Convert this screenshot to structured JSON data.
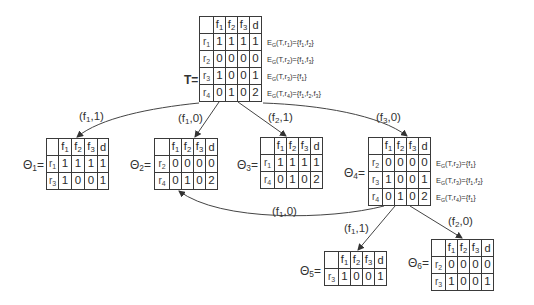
{
  "diagram": {
    "columns": [
      "f1",
      "f2",
      "f3",
      "d"
    ],
    "tables": [
      {
        "id": "T",
        "label": "T=",
        "rows": [
          {
            "name": "r1",
            "values": [
              "1",
              "1",
              "1",
              "1"
            ],
            "eg": "E_G(T,r1)={f1,f2}"
          },
          {
            "name": "r2",
            "values": [
              "0",
              "0",
              "0",
              "0"
            ],
            "eg": "E_G(T,r2)={f1,f3}"
          },
          {
            "name": "r3",
            "values": [
              "1",
              "0",
              "0",
              "1"
            ],
            "eg": "E_G(T,r3)={f1}"
          },
          {
            "name": "r4",
            "values": [
              "0",
              "1",
              "0",
              "2"
            ],
            "eg": "E_G(T,r4)={f1,f2,f3}"
          }
        ]
      },
      {
        "id": "Theta1",
        "label": "Θ1=",
        "rows": [
          {
            "name": "r1",
            "values": [
              "1",
              "1",
              "1",
              "1"
            ]
          },
          {
            "name": "r3",
            "values": [
              "1",
              "0",
              "0",
              "1"
            ]
          }
        ]
      },
      {
        "id": "Theta2",
        "label": "Θ2=",
        "rows": [
          {
            "name": "r2",
            "values": [
              "0",
              "0",
              "0",
              "0"
            ]
          },
          {
            "name": "r4",
            "values": [
              "0",
              "1",
              "0",
              "2"
            ]
          }
        ]
      },
      {
        "id": "Theta3",
        "label": "Θ3=",
        "rows": [
          {
            "name": "r1",
            "values": [
              "1",
              "1",
              "1",
              "1"
            ]
          },
          {
            "name": "r4",
            "values": [
              "0",
              "1",
              "0",
              "2"
            ]
          }
        ]
      },
      {
        "id": "Theta4",
        "label": "Θ4=",
        "rows": [
          {
            "name": "r2",
            "values": [
              "0",
              "0",
              "0",
              "0"
            ],
            "eg": "E_G(T,r2)={f1}"
          },
          {
            "name": "r3",
            "values": [
              "1",
              "0",
              "0",
              "1"
            ],
            "eg": "E_G(T,r3)={f1,f2}"
          },
          {
            "name": "r4",
            "values": [
              "0",
              "1",
              "0",
              "2"
            ],
            "eg": "E_G(T,r4)={f1}"
          }
        ]
      },
      {
        "id": "Theta5",
        "label": "Θ5=",
        "rows": [
          {
            "name": "r3",
            "values": [
              "1",
              "0",
              "0",
              "1"
            ]
          }
        ]
      },
      {
        "id": "Theta6",
        "label": "Θ6=",
        "rows": [
          {
            "name": "r2",
            "values": [
              "0",
              "0",
              "0",
              "0"
            ]
          },
          {
            "name": "r3",
            "values": [
              "1",
              "0",
              "0",
              "1"
            ]
          }
        ]
      }
    ],
    "edges": [
      {
        "from": "T",
        "to": "Theta1",
        "label": "(f1,1)"
      },
      {
        "from": "T",
        "to": "Theta2",
        "label": "(f1,0)"
      },
      {
        "from": "T",
        "to": "Theta3",
        "label": "(f2,1)"
      },
      {
        "from": "T",
        "to": "Theta4",
        "label": "(f3,0)"
      },
      {
        "from": "Theta4",
        "to": "Theta2",
        "label": "(f1,0)"
      },
      {
        "from": "Theta4",
        "to": "Theta5",
        "label": "(f1,1)"
      },
      {
        "from": "Theta4",
        "to": "Theta6",
        "label": "(f2,0)"
      }
    ]
  }
}
